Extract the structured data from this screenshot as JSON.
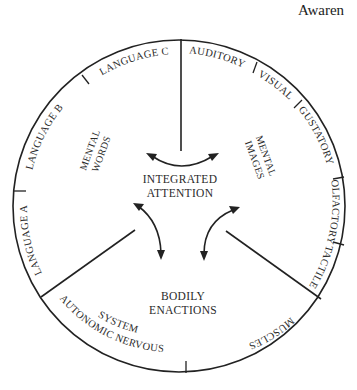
{
  "header": {
    "title_fragment": "Awaren"
  },
  "diagram": {
    "center_label": [
      "INTEGRATED",
      "ATTENTION"
    ],
    "regions": {
      "mental_words": [
        "MENTAL",
        "WORDS"
      ],
      "mental_images": [
        "MENTAL",
        "IMAGES"
      ],
      "bodily_enactions": [
        "BODILY",
        "ENACTIONS"
      ]
    },
    "outer_labels": {
      "language_a": "LANGUAGE A",
      "language_b": "LANGUAGE B",
      "language_c": "LANGUAGE C",
      "auditory": "AUDITORY",
      "visual": "VISUAL",
      "gustatory": "GUSTATORY",
      "olfactory": "OLFACTORY",
      "tactile": "TACTILE",
      "muscles": "MUSCLES",
      "autonomic_1": "AUTONOMIC NERVOUS",
      "autonomic_2": "SYSTEM"
    },
    "colors": {
      "ink": "#222222",
      "background": "#ffffff"
    }
  }
}
